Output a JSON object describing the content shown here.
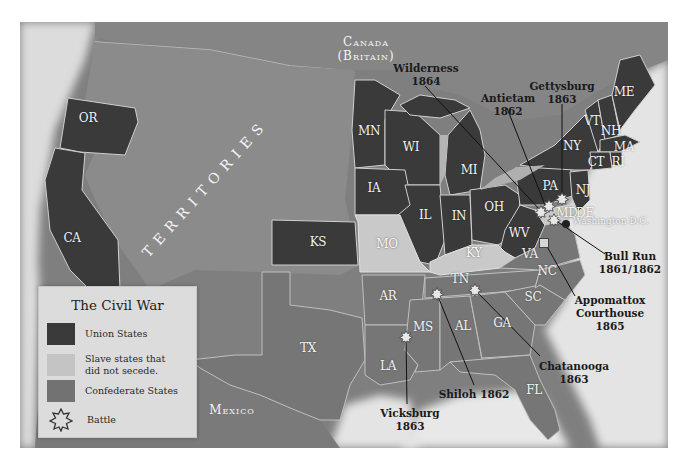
{
  "legend": {
    "title": "The Civil War",
    "items": [
      {
        "label": "Union States",
        "color": "#3a3a3a",
        "icon": "swatch"
      },
      {
        "label": "Slave states that did not secede.",
        "label_line1": "Slave states that",
        "label_line2": "did not secede.",
        "color": "#c4c4c4",
        "icon": "swatch"
      },
      {
        "label": "Confederate States",
        "color": "#727272",
        "icon": "swatch"
      },
      {
        "label": "Battle",
        "icon": "star-icon"
      }
    ]
  },
  "colors": {
    "union": "#3a3a3a",
    "border_slave": "#c9c9c9",
    "confederate": "#767676",
    "territories": "#8a8a8a",
    "canada": "#848484",
    "mexico": "#7a7a7a",
    "ocean": "#e6e6e6"
  },
  "regions": {
    "canada_line1": "Canada",
    "canada_line2": "(Britain)",
    "territories": "TERRITORIES",
    "mexico": "Mexico"
  },
  "states": {
    "union": [
      "OR",
      "CA",
      "MN",
      "WI",
      "IA",
      "KS",
      "IL",
      "IN",
      "MI",
      "OH",
      "WV",
      "PA",
      "NY",
      "NJ",
      "VT",
      "NH",
      "ME",
      "MA",
      "CT",
      "RI"
    ],
    "border": [
      "MO",
      "KY",
      "MD",
      "DE"
    ],
    "confederate": [
      "TX",
      "AR",
      "LA",
      "MS",
      "AL",
      "TN",
      "GA",
      "FL",
      "SC",
      "NC",
      "VA"
    ]
  },
  "labels": {
    "OR": "OR",
    "CA": "CA",
    "MN": "MN",
    "WI": "WI",
    "IA": "IA",
    "KS": "KS",
    "IL": "IL",
    "IN": "IN",
    "MI": "MI",
    "OH": "OH",
    "WV": "WV",
    "PA": "PA",
    "NY": "NY",
    "NJ": "NJ",
    "VT": "VT",
    "NH": "NH",
    "ME": "ME",
    "MA": "MA",
    "CT": "CT",
    "RI": "RI",
    "MO": "MO",
    "KY": "KY",
    "MD": "MD",
    "DE": "DE",
    "TX": "TX",
    "AR": "AR",
    "LA": "LA",
    "MS": "MS",
    "AL": "AL",
    "TN": "TN",
    "GA": "GA",
    "FL": "FL",
    "SC": "SC",
    "NC": "NC",
    "VA": "VA"
  },
  "capital": {
    "label": "Washington D.C."
  },
  "battles": [
    {
      "name": "Wilderness",
      "year": "1864"
    },
    {
      "name": "Antietam",
      "year": "1862"
    },
    {
      "name": "Gettysburg",
      "year": "1863"
    },
    {
      "name": "Bull Run",
      "year": "1861/1862"
    },
    {
      "name": "Appomattox",
      "name2": "Courthouse",
      "year": "1865"
    },
    {
      "name": "Chatanooga",
      "year": "1863"
    },
    {
      "name": "Shiloh 1862",
      "year": ""
    },
    {
      "name": "Vicksburg",
      "year": "1863"
    }
  ]
}
